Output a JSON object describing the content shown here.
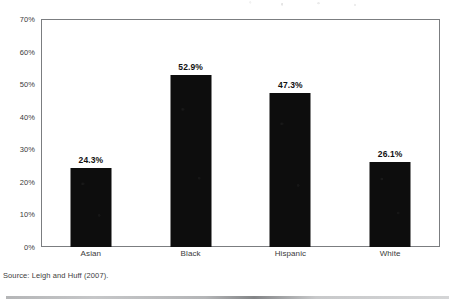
{
  "chart_data": {
    "type": "bar",
    "title": "",
    "subtitle": "",
    "xlabel": "",
    "ylabel": "",
    "categories": [
      "Asian",
      "Black",
      "Hispanic",
      "White"
    ],
    "values": [
      24.3,
      52.9,
      47.3,
      26.1
    ],
    "value_labels": [
      "24.3%",
      "52.9%",
      "47.3%",
      "26.1%"
    ],
    "ylim": [
      0,
      70
    ],
    "ytick_values": [
      0,
      10,
      20,
      30,
      40,
      50,
      60,
      70
    ],
    "ytick_labels": [
      "0%",
      "10%",
      "20%",
      "30%",
      "40%",
      "50%",
      "60%",
      "70%"
    ],
    "grid": false,
    "legend": null,
    "bar_color": "#0d0d0d",
    "frame_color": "#7b7d80"
  },
  "footer": {
    "source": "Source: Leigh and Huff (2007)."
  }
}
